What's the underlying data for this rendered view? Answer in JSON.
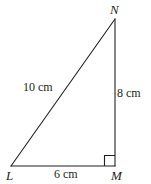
{
  "figure": {
    "type": "right-triangle-geometry-diagram",
    "background_color": "#ffffff",
    "stroke_color": "#231f20",
    "stroke_width": 1,
    "width": 151,
    "height": 184,
    "vertices": [
      {
        "name": "N",
        "label": "N",
        "x": 115,
        "y": 19
      },
      {
        "name": "L",
        "label": "L",
        "x": 11,
        "y": 166
      },
      {
        "name": "M",
        "label": "M",
        "x": 115,
        "y": 166
      }
    ],
    "sides": [
      {
        "name": "LN",
        "label": "10 cm",
        "value": 10,
        "unit": "cm",
        "role": "hypotenuse"
      },
      {
        "name": "NM",
        "label": "8 cm",
        "value": 8,
        "unit": "cm",
        "role": "vertical-leg"
      },
      {
        "name": "LM",
        "label": "6 cm",
        "value": 6,
        "unit": "cm",
        "role": "horizontal-leg"
      }
    ],
    "right_angle": {
      "at_vertex": "M",
      "marker": "square",
      "size": 10
    }
  }
}
